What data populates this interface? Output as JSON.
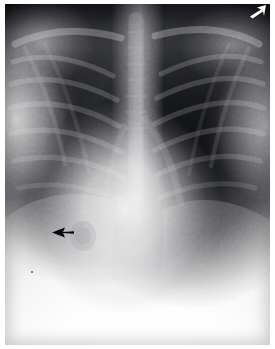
{
  "image": {
    "title": "Chest radiograph",
    "modality": "X-ray",
    "view": "PA chest",
    "width_px": 275,
    "height_px": 349,
    "caption": "",
    "colorspace": "grayscale"
  },
  "plate": {
    "border_color": "#ffffff",
    "background_color": "#111215",
    "margin_left_px": 5,
    "margin_top_px": 4
  },
  "annotations": [
    {
      "id": "lesion-arrow",
      "type": "arrow",
      "color": "#000000",
      "direction": "right",
      "x": 52,
      "y": 226,
      "label": "black arrow indicating right basal opacity"
    },
    {
      "id": "corner-marker",
      "type": "arrow",
      "color": "#ffffff",
      "direction": "up-right",
      "x": 248,
      "y": 4,
      "label": "white corner marker"
    },
    {
      "id": "film-speck",
      "type": "speck",
      "color": "#5a5a5a",
      "x": 31,
      "y": 271,
      "label": "small film artifact"
    }
  ],
  "anatomy": {
    "regions": [
      {
        "name": "right-lung-field",
        "tone": "dark",
        "side": "viewer-left"
      },
      {
        "name": "left-lung-field",
        "tone": "dark",
        "side": "viewer-right"
      },
      {
        "name": "mediastinum",
        "tone": "bright",
        "side": "central"
      },
      {
        "name": "cardiac-silhouette",
        "tone": "bright",
        "side": "central-lower"
      },
      {
        "name": "diaphragm",
        "tone": "bright",
        "side": "lower"
      },
      {
        "name": "chest-wall-soft-tissue",
        "tone": "mid",
        "side": "lateral"
      }
    ]
  },
  "colors": {
    "darkest": "#0e0f12",
    "lung_field": "#1d1e21",
    "mid_tone": "#6e6f72",
    "bright": "#e3e3e3",
    "brightest": "#ffffff",
    "arrow_black": "#000000",
    "arrow_white": "#ffffff"
  }
}
